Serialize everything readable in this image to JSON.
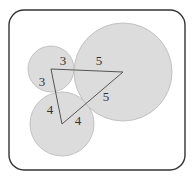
{
  "diagram": {
    "frame": {
      "stroke": "#333333",
      "corner_radius": 15
    },
    "colors": {
      "circle_fill": "#dcdcdc",
      "circle_stroke": "#b8b8b8",
      "line": "#555555",
      "text": "#333333"
    },
    "circles": [
      {
        "id": "small",
        "cx": 51,
        "cy": 69,
        "r": 23
      },
      {
        "id": "bottom",
        "cx": 62,
        "cy": 124,
        "r": 32
      },
      {
        "id": "large",
        "cx": 123,
        "cy": 72,
        "r": 49
      }
    ],
    "triangle": {
      "vertices": [
        [
          51,
          69
        ],
        [
          123,
          72
        ],
        [
          62,
          124
        ]
      ]
    },
    "labels": [
      {
        "text": "3",
        "x": 63,
        "y": 65
      },
      {
        "text": "3",
        "x": 42,
        "y": 86
      },
      {
        "text": "5",
        "x": 99,
        "y": 65
      },
      {
        "text": "5",
        "x": 106,
        "y": 101
      },
      {
        "text": "4",
        "x": 50,
        "y": 114
      },
      {
        "text": "4",
        "x": 78,
        "y": 125
      }
    ]
  }
}
